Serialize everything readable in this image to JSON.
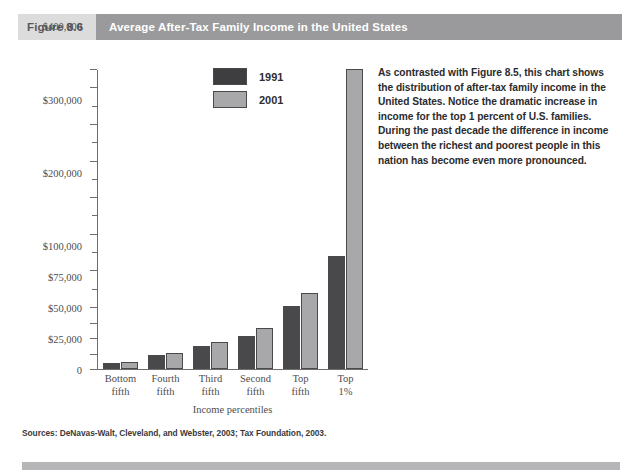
{
  "header": {
    "figure_number": "Figure 8.6",
    "title": "Average After-Tax Family Income in the United States",
    "figure_number_bg": "#dcdcdc",
    "title_bg": "#9a9a9c"
  },
  "caption": {
    "text": "As contrasted with Figure 8.5, this chart shows the distribution of after-tax family income in the United States. Notice the dramatic increase in income for the top 1 percent of U.S. families. During the past decade the difference in income between the richest and poorest people in this nation has become even more pronounced."
  },
  "source": {
    "text": "Sources: DeNavas-Walt, Cleveland, and Webster, 2003; Tax Foundation, 2003."
  },
  "legend": {
    "entries": [
      {
        "label": "1991",
        "color": "#3e3e40"
      },
      {
        "label": "2001",
        "color": "#a8a8aa"
      }
    ]
  },
  "axis": {
    "x_title": "Income percentiles",
    "y_ticks_labeled": [
      "$750,000",
      "$700,000",
      "$600,000",
      "$500,000",
      "$400,000",
      "$300,000",
      "$200,000",
      "$100,000",
      "$75,000",
      "$50,000",
      "$25,000",
      "0"
    ]
  },
  "chart_data": {
    "type": "bar",
    "title": "Average After-Tax Family Income in the United States",
    "xlabel": "Income percentiles",
    "ylabel": "",
    "categories": [
      "Bottom fifth",
      "Fourth fifth",
      "Third fifth",
      "Second fifth",
      "Top fifth",
      "Top 1%"
    ],
    "category_lines": [
      [
        "Bottom",
        "fifth"
      ],
      [
        "Fourth",
        "fifth"
      ],
      [
        "Third",
        "fifth"
      ],
      [
        "Second",
        "fifth"
      ],
      [
        "Top",
        "fifth"
      ],
      [
        "Top",
        "1%"
      ]
    ],
    "series": [
      {
        "name": "1991",
        "color": "#49494b",
        "values": [
          10000,
          23000,
          37000,
          53000,
          103000,
          240000
        ]
      },
      {
        "name": "2001",
        "color": "#a8a8aa",
        "values": [
          12000,
          26000,
          43000,
          66000,
          137000,
          750000
        ]
      }
    ],
    "y_axis_scale": "broken / non-linear below $100,000",
    "y_tick_values": [
      750000,
      700000,
      650000,
      600000,
      550000,
      500000,
      450000,
      400000,
      350000,
      300000,
      250000,
      200000,
      150000,
      100000,
      75000,
      50000,
      25000,
      0
    ],
    "y_tick_labels": {
      "750000": "$750,000",
      "700000": "$700,000",
      "600000": "$600,000",
      "500000": "$500,000",
      "400000": "$400,000",
      "300000": "$300,000",
      "200000": "$200,000",
      "100000": "$100,000",
      "75000": "$75,000",
      "50000": "$50,000",
      "25000": "$25,000",
      "0": "0"
    },
    "ylim": [
      0,
      750000
    ],
    "grid": false,
    "legend_position": "inside-top-left"
  }
}
